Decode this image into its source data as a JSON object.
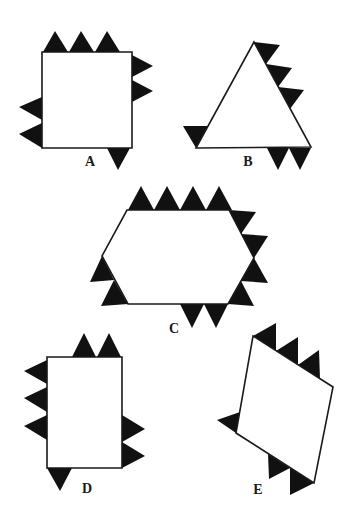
{
  "figure": {
    "colors": {
      "outline": "#1a1a1a",
      "tooth": "#111111",
      "background": "#ffffff"
    },
    "shapes": [
      {
        "id": "A",
        "label": "A",
        "kind": "square",
        "label_pos": [
          90,
          166
        ],
        "polygon": [
          [
            42,
            52
          ],
          [
            132,
            52
          ],
          [
            132,
            148
          ],
          [
            42,
            148
          ]
        ],
        "teeth": [
          [
            [
              43,
              52
            ],
            [
              55,
              31
            ],
            [
              68,
              52
            ]
          ],
          [
            [
              69,
              52
            ],
            [
              81,
              31
            ],
            [
              94,
              52
            ]
          ],
          [
            [
              95,
              52
            ],
            [
              107,
              31
            ],
            [
              120,
              52
            ]
          ],
          [
            [
              132,
              55
            ],
            [
              153,
              66
            ],
            [
              132,
              77
            ]
          ],
          [
            [
              132,
              80
            ],
            [
              153,
              91
            ],
            [
              132,
              102
            ]
          ],
          [
            [
              42,
              97
            ],
            [
              19,
              107
            ],
            [
              42,
              120
            ]
          ],
          [
            [
              42,
              123
            ],
            [
              19,
              134
            ],
            [
              42,
              148
            ]
          ],
          [
            [
              107,
              148
            ],
            [
              118,
              170
            ],
            [
              130,
              148
            ]
          ]
        ]
      },
      {
        "id": "B",
        "label": "B",
        "kind": "triangle",
        "label_pos": [
          248,
          166
        ],
        "polygon": [
          [
            254,
            42
          ],
          [
            311,
            147
          ],
          [
            196,
            148
          ]
        ],
        "teeth": [
          [
            [
              254,
              42
            ],
            [
              280,
              45
            ],
            [
              266,
              64
            ]
          ],
          [
            [
              266,
              64
            ],
            [
              292,
              68
            ],
            [
              278,
              87
            ]
          ],
          [
            [
              278,
              87
            ],
            [
              304,
              90
            ],
            [
              290,
              109
            ]
          ],
          [
            [
              196,
              148
            ],
            [
              183,
              126
            ],
            [
              208,
              126
            ]
          ],
          [
            [
              267,
              148
            ],
            [
              278,
              170
            ],
            [
              289,
              148
            ]
          ],
          [
            [
              289,
              148
            ],
            [
              300,
              170
            ],
            [
              311,
              148
            ]
          ]
        ]
      },
      {
        "id": "C",
        "label": "C",
        "kind": "hexagon",
        "label_pos": [
          174,
          333
        ],
        "polygon": [
          [
            127,
            210
          ],
          [
            229,
            210
          ],
          [
            254,
            258
          ],
          [
            228,
            304
          ],
          [
            128,
            304
          ],
          [
            102,
            256
          ]
        ],
        "teeth": [
          [
            [
              128,
              210
            ],
            [
              141,
              186
            ],
            [
              154,
              210
            ]
          ],
          [
            [
              154,
              210
            ],
            [
              167,
              186
            ],
            [
              180,
              210
            ]
          ],
          [
            [
              180,
              210
            ],
            [
              193,
              186
            ],
            [
              206,
              210
            ]
          ],
          [
            [
              206,
              210
            ],
            [
              219,
              186
            ],
            [
              232,
              210
            ]
          ],
          [
            [
              229,
              210
            ],
            [
              256,
              212
            ],
            [
              241,
              234
            ]
          ],
          [
            [
              241,
              234
            ],
            [
              268,
              236
            ],
            [
              254,
              258
            ]
          ],
          [
            [
              254,
              258
            ],
            [
              268,
              283
            ],
            [
              241,
              281
            ]
          ],
          [
            [
              241,
              281
            ],
            [
              254,
              306
            ],
            [
              228,
              304
            ]
          ],
          [
            [
              102,
              256
            ],
            [
              114,
              280
            ],
            [
              90,
              282
            ]
          ],
          [
            [
              114,
              280
            ],
            [
              128,
              304
            ],
            [
              101,
              306
            ]
          ],
          [
            [
              180,
              304
            ],
            [
              192,
              328
            ],
            [
              204,
              304
            ]
          ],
          [
            [
              204,
              304
            ],
            [
              216,
              328
            ],
            [
              228,
              304
            ]
          ]
        ]
      },
      {
        "id": "D",
        "label": "D",
        "kind": "rectangle",
        "label_pos": [
          87,
          493
        ],
        "polygon": [
          [
            47,
            357
          ],
          [
            122,
            357
          ],
          [
            122,
            468
          ],
          [
            47,
            468
          ]
        ],
        "teeth": [
          [
            [
              72,
              357
            ],
            [
              84,
              333
            ],
            [
              96,
              357
            ]
          ],
          [
            [
              97,
              357
            ],
            [
              109,
              333
            ],
            [
              121,
              357
            ]
          ],
          [
            [
              47,
              360
            ],
            [
              24,
              371
            ],
            [
              47,
              384
            ]
          ],
          [
            [
              47,
              387
            ],
            [
              24,
              398
            ],
            [
              47,
              412
            ]
          ],
          [
            [
              47,
              415
            ],
            [
              24,
              426
            ],
            [
              47,
              440
            ]
          ],
          [
            [
              122,
              415
            ],
            [
              145,
              429
            ],
            [
              122,
              442
            ]
          ],
          [
            [
              122,
              442
            ],
            [
              145,
              456
            ],
            [
              122,
              468
            ]
          ],
          [
            [
              47,
              468
            ],
            [
              60,
              491
            ],
            [
              72,
              468
            ]
          ]
        ]
      },
      {
        "id": "E",
        "label": "E",
        "kind": "parallelogram",
        "label_pos": [
          258,
          494
        ],
        "polygon": [
          [
            253,
            336
          ],
          [
            333,
            387
          ],
          [
            314,
            483
          ],
          [
            236,
            433
          ]
        ],
        "teeth": [
          [
            [
              253,
              336
            ],
            [
              276,
              323
            ],
            [
              276,
              351
            ]
          ],
          [
            [
              276,
              351
            ],
            [
              298,
              337
            ],
            [
              298,
              365
            ]
          ],
          [
            [
              298,
              365
            ],
            [
              319,
              350
            ],
            [
              320,
              379
            ]
          ],
          [
            [
              240,
              412
            ],
            [
              217,
              420
            ],
            [
              236,
              433
            ]
          ],
          [
            [
              268,
              454
            ],
            [
              269,
              479
            ],
            [
              290,
              468
            ]
          ],
          [
            [
              290,
              468
            ],
            [
              290,
              495
            ],
            [
              314,
              483
            ]
          ]
        ]
      }
    ]
  }
}
